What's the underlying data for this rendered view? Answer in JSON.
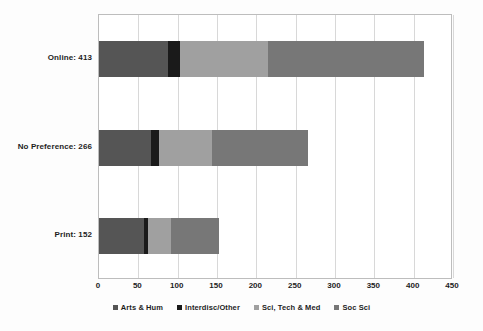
{
  "chart_data": {
    "type": "bar",
    "orientation": "horizontal",
    "stacked": true,
    "title": "",
    "subtitle": "",
    "xlabel": "",
    "ylabel": "",
    "xlim": [
      0,
      450
    ],
    "xticks": [
      0,
      50,
      100,
      150,
      200,
      250,
      300,
      350,
      400,
      450
    ],
    "grid": true,
    "legend_position": "bottom",
    "categories": [
      "Online: 413",
      "No Preference: 266",
      "Print: 152"
    ],
    "category_totals": [
      413,
      266,
      152
    ],
    "series": [
      {
        "name": "Arts & Hum",
        "color": "#555555",
        "values": [
          88,
          66,
          57
        ]
      },
      {
        "name": "Interdisc/Other",
        "color": "#1a1a1a",
        "values": [
          15,
          10,
          5
        ]
      },
      {
        "name": "Sci, Tech & Med",
        "color": "#a0a0a0",
        "values": [
          112,
          68,
          30
        ]
      },
      {
        "name": "Soc Sci",
        "color": "#777777",
        "values": [
          198,
          122,
          60
        ]
      }
    ],
    "legend": [
      {
        "label": "Arts & Hum",
        "color": "#555555"
      },
      {
        "label": "Interdisc/Other",
        "color": "#1a1a1a"
      },
      {
        "label": "Sci, Tech & Med",
        "color": "#a0a0a0"
      },
      {
        "label": "Soc Sci",
        "color": "#777777"
      }
    ],
    "tick_labels": [
      "0",
      "50",
      "100",
      "150",
      "200",
      "250",
      "300",
      "350",
      "400",
      "450"
    ],
    "colors": {
      "plot_background": "#ffffff",
      "page_background": "#fdfdfd",
      "gridline": "#d8d8d8",
      "frame": "#bdbdbd",
      "text": "#1d1d1d"
    }
  }
}
